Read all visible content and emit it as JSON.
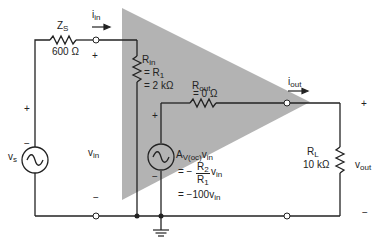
{
  "diagram": {
    "type": "equivalent-circuit",
    "colors": {
      "amplifier_fill": "#b3b3b3",
      "wire": "#222222",
      "background": "#ffffff"
    },
    "source": {
      "name": "v",
      "sub": "s",
      "plus": "+",
      "minus": "−"
    },
    "source_impedance": {
      "name": "Z",
      "sub": "S",
      "value": "600 Ω"
    },
    "input_current": {
      "name": "i",
      "sub": "in"
    },
    "input_voltage": {
      "name": "v",
      "sub": "in",
      "plus": "+",
      "minus": "−"
    },
    "input_resistance": {
      "name": "R",
      "sub": "in",
      "line2": "= R",
      "line2_sub": "1",
      "line3": "= 2 kΩ"
    },
    "output_resistance": {
      "name": "R",
      "sub": "out",
      "line2": "= 0 Ω"
    },
    "dependent_source": {
      "name": "A",
      "sub": "V(oc)",
      "var": "v",
      "var_sub": "in",
      "plus": "+",
      "minus": "−",
      "eq_prefix": "= −",
      "numerator": "R",
      "numerator_sub": "2",
      "denominator": "R",
      "denominator_sub": "1",
      "eq_var": "v",
      "eq_var_sub": "in",
      "result": "= −100v",
      "result_sub": "in"
    },
    "output_current": {
      "name": "i",
      "sub": "out"
    },
    "load": {
      "name": "R",
      "sub": "L",
      "value": "10 kΩ"
    },
    "output_voltage": {
      "name": "v",
      "sub": "out",
      "plus": "+",
      "minus": "−"
    }
  }
}
